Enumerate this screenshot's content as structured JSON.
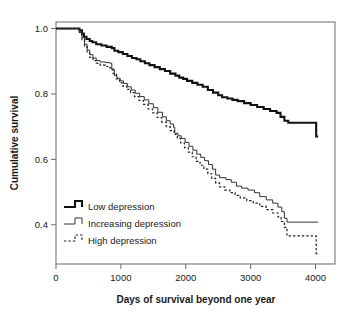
{
  "chart_data": {
    "type": "line",
    "subtype": "kaplan-meier-step",
    "title": "",
    "xlabel": "Days of survival beyond one year",
    "ylabel": "Cumulative survival",
    "xlim": [
      0,
      4300
    ],
    "ylim": [
      0.28,
      1.02
    ],
    "xticks": [
      0,
      1000,
      2000,
      3000,
      4000
    ],
    "xtick_labels": [
      "0",
      "1000",
      "2000",
      "3000",
      "4000"
    ],
    "yticks": [
      0.4,
      0.6,
      0.8,
      1.0
    ],
    "ytick_labels": [
      "0.4",
      "0.6",
      "0.8",
      "1.0"
    ],
    "grid": false,
    "legend_position": "lower-left-inside",
    "series": [
      {
        "name": "Low depression",
        "style": "solid-thick",
        "color": "#111111",
        "points": [
          [
            0,
            1.0
          ],
          [
            330,
            1.0
          ],
          [
            360,
            0.995
          ],
          [
            400,
            0.985
          ],
          [
            430,
            0.975
          ],
          [
            470,
            0.968
          ],
          [
            520,
            0.962
          ],
          [
            560,
            0.958
          ],
          [
            620,
            0.952
          ],
          [
            700,
            0.948
          ],
          [
            780,
            0.944
          ],
          [
            860,
            0.94
          ],
          [
            900,
            0.932
          ],
          [
            960,
            0.928
          ],
          [
            1030,
            0.922
          ],
          [
            1100,
            0.916
          ],
          [
            1170,
            0.91
          ],
          [
            1240,
            0.906
          ],
          [
            1300,
            0.9
          ],
          [
            1370,
            0.894
          ],
          [
            1440,
            0.888
          ],
          [
            1520,
            0.882
          ],
          [
            1600,
            0.876
          ],
          [
            1680,
            0.87
          ],
          [
            1760,
            0.862
          ],
          [
            1840,
            0.856
          ],
          [
            1900,
            0.85
          ],
          [
            1960,
            0.846
          ],
          [
            2020,
            0.84
          ],
          [
            2100,
            0.834
          ],
          [
            2180,
            0.828
          ],
          [
            2260,
            0.822
          ],
          [
            2340,
            0.812
          ],
          [
            2420,
            0.804
          ],
          [
            2500,
            0.796
          ],
          [
            2560,
            0.79
          ],
          [
            2640,
            0.786
          ],
          [
            2720,
            0.782
          ],
          [
            2800,
            0.778
          ],
          [
            2900,
            0.772
          ],
          [
            3000,
            0.766
          ],
          [
            3100,
            0.76
          ],
          [
            3200,
            0.754
          ],
          [
            3300,
            0.748
          ],
          [
            3400,
            0.742
          ],
          [
            3460,
            0.73
          ],
          [
            3520,
            0.718
          ],
          [
            3580,
            0.712
          ],
          [
            4000,
            0.712
          ],
          [
            4010,
            0.67
          ],
          [
            4040,
            0.67
          ]
        ]
      },
      {
        "name": "Increasing depression",
        "style": "solid-thin",
        "color": "#333333",
        "points": [
          [
            0,
            1.0
          ],
          [
            330,
            1.0
          ],
          [
            360,
            0.99
          ],
          [
            400,
            0.972
          ],
          [
            440,
            0.952
          ],
          [
            480,
            0.934
          ],
          [
            520,
            0.92
          ],
          [
            570,
            0.91
          ],
          [
            620,
            0.902
          ],
          [
            680,
            0.898
          ],
          [
            760,
            0.896
          ],
          [
            830,
            0.894
          ],
          [
            860,
            0.874
          ],
          [
            900,
            0.856
          ],
          [
            940,
            0.848
          ],
          [
            990,
            0.84
          ],
          [
            1040,
            0.832
          ],
          [
            1100,
            0.822
          ],
          [
            1160,
            0.812
          ],
          [
            1220,
            0.802
          ],
          [
            1290,
            0.792
          ],
          [
            1360,
            0.782
          ],
          [
            1430,
            0.77
          ],
          [
            1500,
            0.758
          ],
          [
            1570,
            0.744
          ],
          [
            1640,
            0.73
          ],
          [
            1700,
            0.718
          ],
          [
            1760,
            0.708
          ],
          [
            1810,
            0.698
          ],
          [
            1830,
            0.68
          ],
          [
            1880,
            0.672
          ],
          [
            1930,
            0.664
          ],
          [
            1990,
            0.652
          ],
          [
            2050,
            0.64
          ],
          [
            2110,
            0.628
          ],
          [
            2170,
            0.616
          ],
          [
            2230,
            0.606
          ],
          [
            2290,
            0.596
          ],
          [
            2350,
            0.584
          ],
          [
            2410,
            0.57
          ],
          [
            2460,
            0.552
          ],
          [
            2520,
            0.544
          ],
          [
            2620,
            0.538
          ],
          [
            2700,
            0.53
          ],
          [
            2780,
            0.518
          ],
          [
            2860,
            0.512
          ],
          [
            2960,
            0.506
          ],
          [
            3060,
            0.498
          ],
          [
            3140,
            0.486
          ],
          [
            3240,
            0.476
          ],
          [
            3340,
            0.466
          ],
          [
            3420,
            0.454
          ],
          [
            3480,
            0.44
          ],
          [
            3520,
            0.42
          ],
          [
            3560,
            0.408
          ],
          [
            4010,
            0.408
          ],
          [
            4040,
            0.408
          ]
        ]
      },
      {
        "name": "High depression",
        "style": "dotted",
        "color": "#222222",
        "points": [
          [
            0,
            1.0
          ],
          [
            330,
            1.0
          ],
          [
            360,
            0.988
          ],
          [
            400,
            0.966
          ],
          [
            440,
            0.944
          ],
          [
            480,
            0.926
          ],
          [
            520,
            0.912
          ],
          [
            570,
            0.902
          ],
          [
            620,
            0.894
          ],
          [
            680,
            0.888
          ],
          [
            760,
            0.884
          ],
          [
            830,
            0.88
          ],
          [
            880,
            0.862
          ],
          [
            930,
            0.846
          ],
          [
            980,
            0.834
          ],
          [
            1030,
            0.824
          ],
          [
            1090,
            0.814
          ],
          [
            1150,
            0.804
          ],
          [
            1210,
            0.792
          ],
          [
            1280,
            0.78
          ],
          [
            1350,
            0.768
          ],
          [
            1420,
            0.754
          ],
          [
            1490,
            0.742
          ],
          [
            1560,
            0.728
          ],
          [
            1630,
            0.714
          ],
          [
            1700,
            0.7
          ],
          [
            1760,
            0.688
          ],
          [
            1820,
            0.676
          ],
          [
            1870,
            0.664
          ],
          [
            1920,
            0.65
          ],
          [
            1980,
            0.636
          ],
          [
            2040,
            0.622
          ],
          [
            2100,
            0.608
          ],
          [
            2160,
            0.594
          ],
          [
            2220,
            0.582
          ],
          [
            2280,
            0.57
          ],
          [
            2340,
            0.556
          ],
          [
            2400,
            0.542
          ],
          [
            2460,
            0.528
          ],
          [
            2520,
            0.516
          ],
          [
            2600,
            0.506
          ],
          [
            2680,
            0.498
          ],
          [
            2760,
            0.49
          ],
          [
            2840,
            0.482
          ],
          [
            2940,
            0.474
          ],
          [
            3040,
            0.466
          ],
          [
            3140,
            0.456
          ],
          [
            3240,
            0.446
          ],
          [
            3340,
            0.436
          ],
          [
            3420,
            0.424
          ],
          [
            3470,
            0.41
          ],
          [
            3520,
            0.392
          ],
          [
            3560,
            0.366
          ],
          [
            3980,
            0.366
          ],
          [
            4010,
            0.312
          ],
          [
            4040,
            0.312
          ]
        ]
      }
    ]
  },
  "legend": {
    "items": [
      {
        "label": "Low depression",
        "marker": "step-solid-thick"
      },
      {
        "label": "Increasing depression",
        "marker": "step-solid-thin"
      },
      {
        "label": "High depression",
        "marker": "step-dotted"
      }
    ]
  },
  "axes": {
    "x_title": "Days of survival beyond one year",
    "y_title": "Cumulative survival"
  },
  "colors": {
    "frame": "#6b6b6b",
    "text": "#1a1a1a",
    "low": "#111111",
    "increasing": "#333333",
    "high": "#222222",
    "background": "#ffffff"
  }
}
